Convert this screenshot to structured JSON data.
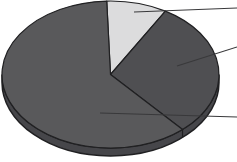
{
  "figure": {
    "background_color": "#ffffff",
    "outline_color": "#202022",
    "rim_color": "#46464a",
    "callout_line_color": "#39393b",
    "width_px": 237,
    "height_px": 162
  },
  "chart_data": {
    "type": "pie",
    "style": "3d-ellipse",
    "title": "",
    "xlabel": "",
    "ylabel": "",
    "legend_position": "none",
    "labels_visible": false,
    "direction": "clockwise",
    "start_angle_deg": -2,
    "slices": [
      {
        "name": "light-slice",
        "value_percent": 9,
        "color": "#dcdcdd"
      },
      {
        "name": "medium-dark-slice",
        "value_percent": 30,
        "color": "#4f4f52"
      },
      {
        "name": "dark-slice",
        "value_percent": 61,
        "color": "#59595b"
      }
    ],
    "callout_lines": [
      {
        "slice": "light-slice",
        "from_x": 134,
        "from_y": 12,
        "to_x": 237,
        "to_y": 8
      },
      {
        "slice": "medium-dark-slice",
        "from_x": 177,
        "from_y": 66,
        "to_x": 237,
        "to_y": 47
      },
      {
        "slice": "dark-slice",
        "from_x": 100,
        "from_y": 113,
        "to_x": 237,
        "to_y": 117
      }
    ]
  }
}
